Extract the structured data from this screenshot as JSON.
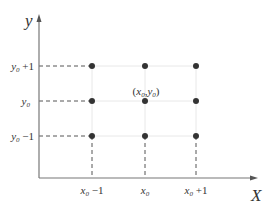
{
  "diagram": {
    "axes": {
      "x_label": "X",
      "y_label": "y"
    },
    "x_ticks": [
      {
        "base": "x",
        "sub": "0",
        "suffix": " −1"
      },
      {
        "base": "x",
        "sub": "0",
        "suffix": ""
      },
      {
        "base": "x",
        "sub": "0",
        "suffix": " +1"
      }
    ],
    "y_ticks": [
      {
        "base": "y",
        "sub": "0",
        "suffix": " +1"
      },
      {
        "base": "y",
        "sub": "0",
        "suffix": ""
      },
      {
        "base": "y",
        "sub": "0",
        "suffix": " −1"
      }
    ],
    "center_label": {
      "open": "(",
      "x": "x",
      "xsub": "0",
      "sep": ",",
      "y": "y",
      "ysub": "0",
      "close": ")"
    },
    "points": 9,
    "colors": {
      "axis": "#666666",
      "dot": "#333333",
      "dashed": "#555555",
      "grid": "#e6e6e6"
    }
  }
}
